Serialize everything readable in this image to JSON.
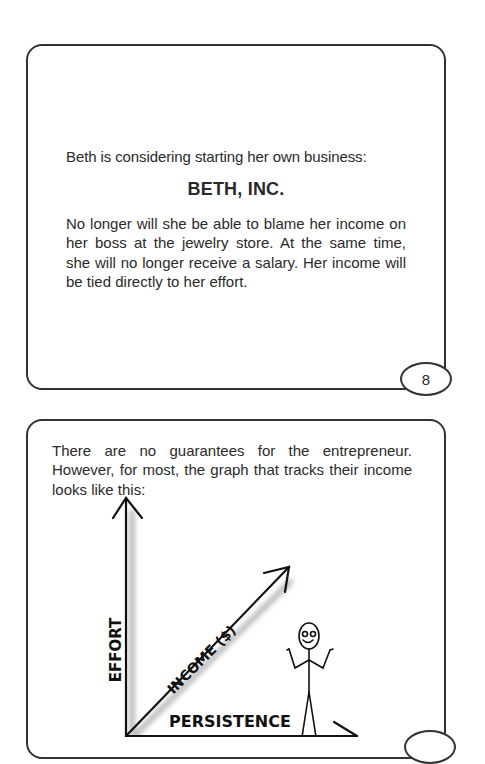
{
  "card1": {
    "intro": "Beth is considering starting her own business:",
    "title": "BETH, INC.",
    "paragraph": "No longer will she be able to blame her income on her boss at the jewelry store. At the same time, she will no longer receive a salary. Her income will be tied directly to her effort.",
    "page_number": "8"
  },
  "card2": {
    "intro": "There are no guarantees for the entrepreneur. However, for most, the graph that tracks their income looks like this:",
    "graph": {
      "y_axis_label": "EFFORT",
      "diagonal_label": "INCOME ($)",
      "x_axis_label": "PERSISTENCE",
      "figure": "stick-figure-shrugging"
    }
  }
}
